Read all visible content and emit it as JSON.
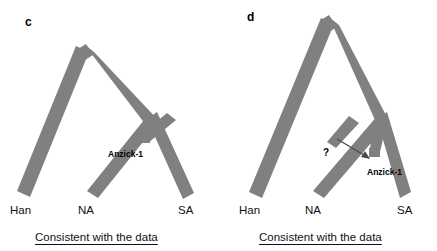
{
  "figure": {
    "background_color": "#ffffff",
    "branch_color": "#808080",
    "text_color": "#111111"
  },
  "panels": [
    {
      "letter": "c",
      "tips": [
        {
          "name": "Han",
          "label": "Han"
        },
        {
          "name": "NA",
          "label": "NA"
        },
        {
          "name": "SA",
          "label": "SA"
        }
      ],
      "node_labels": [
        {
          "name": "anzick",
          "label": "Anzick-1"
        }
      ],
      "annotations": [],
      "caption": "Consistent with the data"
    },
    {
      "letter": "d",
      "tips": [
        {
          "name": "Han",
          "label": "Han"
        },
        {
          "name": "NA",
          "label": "NA"
        },
        {
          "name": "SA",
          "label": "SA"
        }
      ],
      "node_labels": [
        {
          "name": "anzick",
          "label": "Anzick-1"
        }
      ],
      "annotations": [
        {
          "name": "unknown-lineage",
          "label": "?"
        }
      ],
      "caption": "Consistent with the data"
    }
  ]
}
